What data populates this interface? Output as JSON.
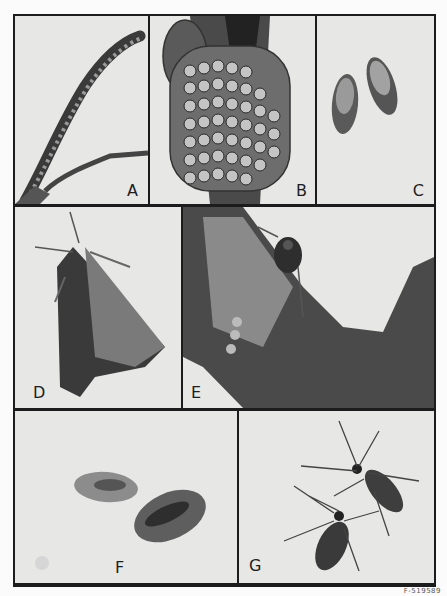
{
  "plate": {
    "panels": [
      {
        "id": "A",
        "label": "A",
        "subject": "caterpillar on twig"
      },
      {
        "id": "B",
        "label": "B",
        "subject": "egg mass on branch"
      },
      {
        "id": "C",
        "label": "C",
        "subject": "two pupae"
      },
      {
        "id": "D",
        "label": "D",
        "subject": "adult moth"
      },
      {
        "id": "E",
        "label": "E",
        "subject": "wasp on bark with cocoons"
      },
      {
        "id": "F",
        "label": "F",
        "subject": "two cocoons"
      },
      {
        "id": "G",
        "label": "G",
        "subject": "two adult parasitic wasps"
      }
    ],
    "caption": "F-519589"
  },
  "colors": {
    "frame": "#1c1c1c",
    "panel_bg": "#e7e7e5",
    "page_bg": "#fbfbfb"
  }
}
